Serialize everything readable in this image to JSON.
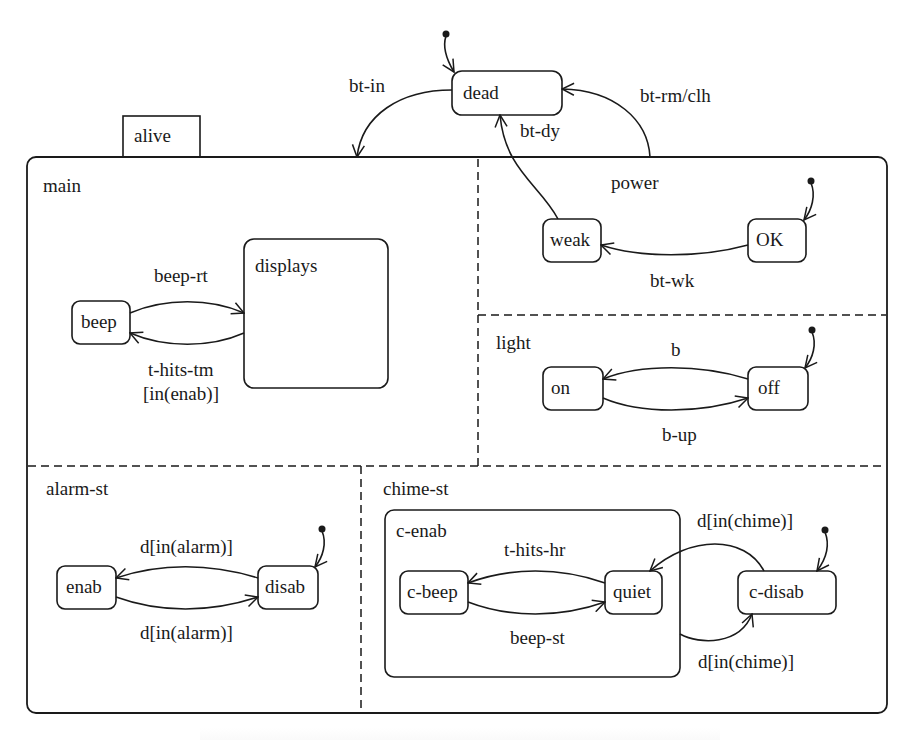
{
  "diagram": {
    "type": "statechart",
    "top_state": "alive",
    "external_states": [
      {
        "id": "dead",
        "label": "dead"
      }
    ],
    "regions": [
      {
        "id": "main",
        "label": "main",
        "states": [
          {
            "id": "beep",
            "label": "beep"
          },
          {
            "id": "displays",
            "label": "displays"
          }
        ]
      },
      {
        "id": "power",
        "label": "power",
        "states": [
          {
            "id": "weak",
            "label": "weak"
          },
          {
            "id": "OK",
            "label": "OK",
            "initial": true
          }
        ]
      },
      {
        "id": "light",
        "label": "light",
        "states": [
          {
            "id": "on",
            "label": "on"
          },
          {
            "id": "off",
            "label": "off",
            "initial": true
          }
        ]
      },
      {
        "id": "alarm-st",
        "label": "alarm-st",
        "states": [
          {
            "id": "enab",
            "label": "enab"
          },
          {
            "id": "disab",
            "label": "disab",
            "initial": true
          }
        ]
      },
      {
        "id": "chime-st",
        "label": "chime-st",
        "states": [
          {
            "id": "c-enab",
            "label": "c-enab",
            "states": [
              {
                "id": "c-beep",
                "label": "c-beep"
              },
              {
                "id": "quiet",
                "label": "quiet"
              }
            ]
          },
          {
            "id": "c-disab",
            "label": "c-disab",
            "initial": true
          }
        ]
      }
    ],
    "transitions": [
      {
        "from": "dead",
        "to": "alive",
        "label": "bt-in"
      },
      {
        "from": "alive",
        "to": "dead",
        "label": "bt-rm/clh"
      },
      {
        "from": "weak",
        "to": "dead",
        "label": "bt-dy"
      },
      {
        "from": "OK",
        "to": "weak",
        "label": "bt-wk"
      },
      {
        "from": "beep",
        "to": "displays",
        "label": "beep-rt"
      },
      {
        "from": "displays",
        "to": "beep",
        "label": "t-hits-tm",
        "label2": "[in(enab)]"
      },
      {
        "from": "off",
        "to": "on",
        "label": "b"
      },
      {
        "from": "on",
        "to": "off",
        "label": "b-up"
      },
      {
        "from": "disab",
        "to": "enab",
        "label": "d[in(alarm)]"
      },
      {
        "from": "enab",
        "to": "disab",
        "label": "d[in(alarm)]"
      },
      {
        "from": "quiet",
        "to": "c-beep",
        "label": "t-hits-hr"
      },
      {
        "from": "c-beep",
        "to": "quiet",
        "label": "beep-st"
      },
      {
        "from": "c-disab",
        "to": "quiet",
        "label": "d[in(chime)]"
      },
      {
        "from": "c-enab",
        "to": "c-disab",
        "label": "d[in(chime)]"
      }
    ]
  },
  "labels": {
    "alive": "alive",
    "dead": "dead",
    "main": "main",
    "power": "power",
    "light": "light",
    "alarm_st": "alarm-st",
    "chime_st": "chime-st",
    "c_enab": "c-enab",
    "beep": "beep",
    "displays": "displays",
    "weak": "weak",
    "ok": "OK",
    "on": "on",
    "off": "off",
    "enab": "enab",
    "disab": "disab",
    "c_beep": "c-beep",
    "quiet": "quiet",
    "c_disab": "c-disab",
    "t_bt_in": "bt-in",
    "t_bt_rm": "bt-rm/clh",
    "t_bt_dy": "bt-dy",
    "t_bt_wk": "bt-wk",
    "t_beep_rt": "beep-rt",
    "t_hits_tm": "t-hits-tm",
    "t_hits_tm_guard": "[in(enab)]",
    "t_b": "b",
    "t_b_up": "b-up",
    "t_alarm_top": "d[in(alarm)]",
    "t_alarm_bottom": "d[in(alarm)]",
    "t_hits_hr": "t-hits-hr",
    "t_beep_st": "beep-st",
    "t_chime_top": "d[in(chime)]",
    "t_chime_bottom": "d[in(chime)]"
  }
}
